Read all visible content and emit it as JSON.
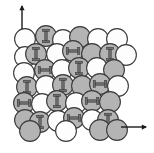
{
  "figure": {
    "width": 154,
    "height": 153,
    "background_color": "#ffffff",
    "caption": ""
  },
  "colors": {
    "sphere_light_fill": "#fdfdfd",
    "sphere_shaded_fill": "#b4b4b4",
    "sphere_outline": "#3a3a3a",
    "marker_fill": "#6e6e6e",
    "marker_outline": "#2f2f2f",
    "axis_arrow": "#1a1a1a"
  },
  "geometry": {
    "sphere_radius": 10.4,
    "outline_width": 1.1,
    "marker_bar_length": 9.2,
    "marker_bar_thickness": 2.4,
    "marker_cap_length": 7.0,
    "marker_cap_thickness": 2.2
  },
  "axes": {
    "vertical_arrow": {
      "label": "",
      "direction": "up",
      "x": 22,
      "y_tail": 29,
      "y_head": 6,
      "head_size": 4.2
    },
    "horizontal_arrow": {
      "label": "",
      "direction": "right",
      "y": 127,
      "x_tail": 121,
      "x_head": 146,
      "head_size": 4.2
    }
  },
  "legend": {
    "light_sphere_name": "unshaded-sphere",
    "shaded_sphere_name": "shaded-sphere",
    "vertical_marker_name": "vertical-dumbbell-marker",
    "horizontal_marker_name": "horizontal-dumbbell-marker"
  },
  "lattice": {
    "rows": 6,
    "description": "close-packed sphere lattice with two sublattices",
    "spheres": [
      {
        "id": "s-r1-c1",
        "cx": 25,
        "cy": 39,
        "shade": "light",
        "marker": "none"
      },
      {
        "id": "s-r1-c2",
        "cx": 46,
        "cy": 36,
        "shade": "shaded",
        "marker": "vertical"
      },
      {
        "id": "s-r1-c3",
        "cx": 63,
        "cy": 40,
        "shade": "light",
        "marker": "none"
      },
      {
        "id": "s-r1-c4",
        "cx": 80,
        "cy": 37,
        "shade": "shaded",
        "marker": "none"
      },
      {
        "id": "s-r1-c5",
        "cx": 98,
        "cy": 39,
        "shade": "light",
        "marker": "none"
      },
      {
        "id": "s-r1-c6",
        "cx": 117,
        "cy": 39,
        "shade": "light",
        "marker": "none"
      },
      {
        "id": "s-r2-c1",
        "cx": 25,
        "cy": 57,
        "shade": "light",
        "marker": "none"
      },
      {
        "id": "s-r2-c2",
        "cx": 36,
        "cy": 54,
        "shade": "shaded",
        "marker": "vertical"
      },
      {
        "id": "s-r2-c3",
        "cx": 57,
        "cy": 54,
        "shade": "light",
        "marker": "none"
      },
      {
        "id": "s-r2-c4",
        "cx": 73,
        "cy": 51,
        "shade": "shaded",
        "marker": "horizontal"
      },
      {
        "id": "s-r2-c5",
        "cx": 92,
        "cy": 54,
        "shade": "shaded",
        "marker": "none"
      },
      {
        "id": "s-r2-c6",
        "cx": 110,
        "cy": 54,
        "shade": "shaded",
        "marker": "vertical"
      },
      {
        "id": "s-r2-c7",
        "cx": 126,
        "cy": 55,
        "shade": "light",
        "marker": "none"
      },
      {
        "id": "s-r3-c1",
        "cx": 24,
        "cy": 73,
        "shade": "light",
        "marker": "none"
      },
      {
        "id": "s-r3-c2",
        "cx": 45,
        "cy": 70,
        "shade": "shaded",
        "marker": "horizontal"
      },
      {
        "id": "s-r3-c3",
        "cx": 62,
        "cy": 70,
        "shade": "light",
        "marker": "none"
      },
      {
        "id": "s-r3-c4",
        "cx": 79,
        "cy": 68,
        "shade": "shaded",
        "marker": "vertical"
      },
      {
        "id": "s-r3-c5",
        "cx": 97,
        "cy": 68,
        "shade": "light",
        "marker": "none"
      },
      {
        "id": "s-r3-c6",
        "cx": 114,
        "cy": 70,
        "shade": "shaded",
        "marker": "none"
      },
      {
        "id": "s-r4-c1",
        "cx": 27,
        "cy": 87,
        "shade": "shaded",
        "marker": "vertical"
      },
      {
        "id": "s-r4-c2",
        "cx": 46,
        "cy": 86,
        "shade": "light",
        "marker": "none"
      },
      {
        "id": "s-r4-c3",
        "cx": 63,
        "cy": 85,
        "shade": "shaded",
        "marker": "vertical"
      },
      {
        "id": "s-r4-c4",
        "cx": 82,
        "cy": 86,
        "shade": "shaded",
        "marker": "none"
      },
      {
        "id": "s-r4-c5",
        "cx": 100,
        "cy": 84,
        "shade": "shaded",
        "marker": "horizontal"
      },
      {
        "id": "s-r4-c6",
        "cx": 118,
        "cy": 86,
        "shade": "light",
        "marker": "none"
      },
      {
        "id": "s-r5-c1",
        "cx": 24,
        "cy": 103,
        "shade": "shaded",
        "marker": "horizontal"
      },
      {
        "id": "s-r5-c2",
        "cx": 42,
        "cy": 104,
        "shade": "light",
        "marker": "none"
      },
      {
        "id": "s-r5-c3",
        "cx": 57,
        "cy": 101,
        "shade": "shaded",
        "marker": "vertical"
      },
      {
        "id": "s-r5-c4",
        "cx": 76,
        "cy": 103,
        "shade": "light",
        "marker": "none"
      },
      {
        "id": "s-r5-c5",
        "cx": 92,
        "cy": 101,
        "shade": "shaded",
        "marker": "horizontal"
      },
      {
        "id": "s-r5-c6",
        "cx": 110,
        "cy": 102,
        "shade": "shaded",
        "marker": "none"
      },
      {
        "id": "s-r6-c1",
        "cx": 25,
        "cy": 120,
        "shade": "shaded",
        "marker": "none"
      },
      {
        "id": "s-r6-c2",
        "cx": 40,
        "cy": 122,
        "shade": "shaded",
        "marker": "vertical"
      },
      {
        "id": "s-r6-c3",
        "cx": 58,
        "cy": 121,
        "shade": "light",
        "marker": "none"
      },
      {
        "id": "s-r6-c4",
        "cx": 74,
        "cy": 118,
        "shade": "shaded",
        "marker": "horizontal"
      },
      {
        "id": "s-r6-c5",
        "cx": 92,
        "cy": 120,
        "shade": "light",
        "marker": "none"
      },
      {
        "id": "s-r6-c6",
        "cx": 108,
        "cy": 120,
        "shade": "shaded",
        "marker": "vertical"
      },
      {
        "id": "s-r7-c1",
        "cx": 30,
        "cy": 131,
        "shade": "shaded",
        "marker": "none"
      },
      {
        "id": "s-r7-c2",
        "cx": 66,
        "cy": 131,
        "shade": "light",
        "marker": "none"
      },
      {
        "id": "s-r7-c3",
        "cx": 100,
        "cy": 130,
        "shade": "shaded",
        "marker": "none"
      },
      {
        "id": "s-r7-c4",
        "cx": 117,
        "cy": 130,
        "shade": "shaded",
        "marker": "none"
      }
    ]
  }
}
